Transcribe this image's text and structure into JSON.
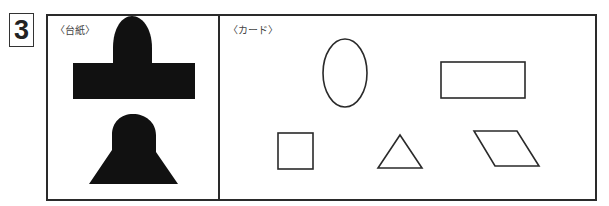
{
  "question_number": "3",
  "panels": {
    "base": {
      "label": "〈台紙〉",
      "shapes": [
        "dome-on-rectangle (filled black)",
        "dome-on-trapezoid (filled black)"
      ]
    },
    "cards": {
      "label": "〈カード〉",
      "shapes": [
        "ellipse",
        "rectangle",
        "square",
        "triangle",
        "parallelogram"
      ]
    }
  },
  "colors": {
    "stroke": "#2a2a2a",
    "fill": "#111111",
    "background": "#ffffff"
  }
}
